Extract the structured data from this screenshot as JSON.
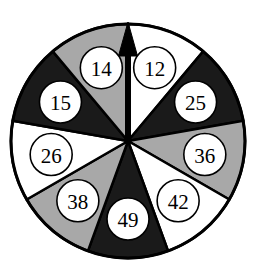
{
  "figure": {
    "name": "spinner-wheel",
    "background_color": "#ffffff",
    "outline_color": "#000000",
    "center_x": 128,
    "center_y": 141,
    "radius": 117,
    "sector_count": 9,
    "sector_angle_deg": 40,
    "label_radius": 78,
    "label_circle_radius": 21,
    "label_circle_fill": "#ffffff",
    "label_circle_stroke": "#000000"
  },
  "palette": {
    "white": "#ffffff",
    "gray": "#a8a8a8",
    "black": "#1a1a1a",
    "outline": "#000000",
    "label_text": "#000000"
  },
  "pointer": {
    "name": "pointer-arrow",
    "direction": "up",
    "angle_deg": 0,
    "color": "#000000",
    "length": 119,
    "shaft_width": 5,
    "head_width": 19,
    "head_length": 34
  },
  "chart_data": {
    "type": "pie",
    "title": "",
    "subtitle": "",
    "xlabel": "",
    "ylabel": "",
    "legend_position": "none",
    "grid": false,
    "equal_sectors": true,
    "start_angle_deg": 0,
    "direction": "clockwise",
    "categories": [
      "12",
      "25",
      "36",
      "42",
      "49",
      "38",
      "26",
      "15",
      "14"
    ],
    "values": [
      40,
      40,
      40,
      40,
      40,
      40,
      40,
      40,
      40
    ],
    "annotations": [
      "pointer arrow points up into sector 12 / 14 boundary"
    ],
    "slices": [
      {
        "label": "12",
        "fill": "white",
        "color": "#ffffff",
        "start_deg": 0,
        "end_deg": 40,
        "mid_deg": 20,
        "share_pct": 11.1
      },
      {
        "label": "25",
        "fill": "black",
        "color": "#1a1a1a",
        "start_deg": 40,
        "end_deg": 80,
        "mid_deg": 60,
        "share_pct": 11.1
      },
      {
        "label": "36",
        "fill": "gray",
        "color": "#a8a8a8",
        "start_deg": 80,
        "end_deg": 120,
        "mid_deg": 100,
        "share_pct": 11.1
      },
      {
        "label": "42",
        "fill": "white",
        "color": "#ffffff",
        "start_deg": 120,
        "end_deg": 160,
        "mid_deg": 140,
        "share_pct": 11.1
      },
      {
        "label": "49",
        "fill": "black",
        "color": "#1a1a1a",
        "start_deg": 160,
        "end_deg": 200,
        "mid_deg": 180,
        "share_pct": 11.1
      },
      {
        "label": "38",
        "fill": "gray",
        "color": "#a8a8a8",
        "start_deg": 200,
        "end_deg": 240,
        "mid_deg": 220,
        "share_pct": 11.1
      },
      {
        "label": "26",
        "fill": "white",
        "color": "#ffffff",
        "start_deg": 240,
        "end_deg": 280,
        "mid_deg": 260,
        "share_pct": 11.1
      },
      {
        "label": "15",
        "fill": "black",
        "color": "#1a1a1a",
        "start_deg": 280,
        "end_deg": 320,
        "mid_deg": 300,
        "share_pct": 11.1
      },
      {
        "label": "14",
        "fill": "gray",
        "color": "#a8a8a8",
        "start_deg": 320,
        "end_deg": 360,
        "mid_deg": 340,
        "share_pct": 11.1
      }
    ]
  }
}
